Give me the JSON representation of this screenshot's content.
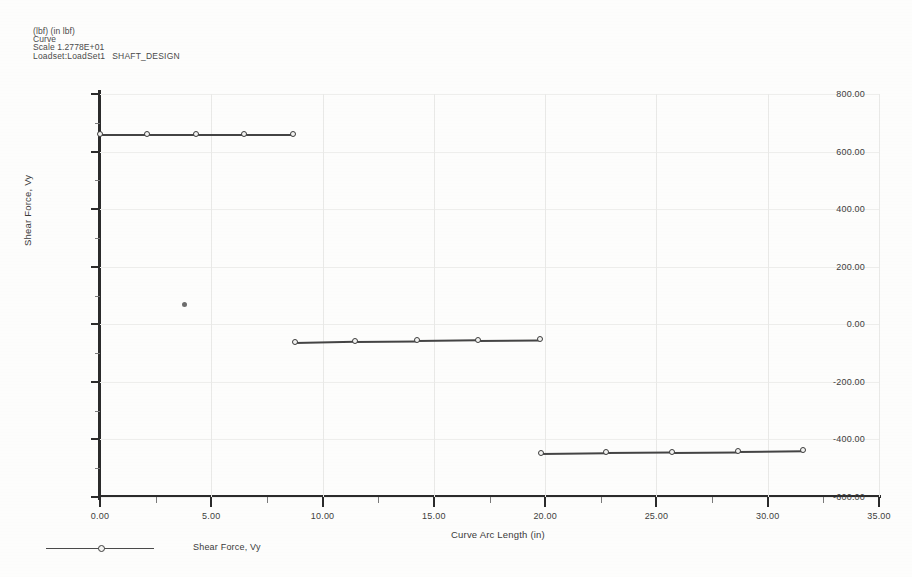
{
  "header": {
    "units": "(lbf)  (in lbf)",
    "curve_label": "Curve",
    "scale_label": "Scale  1.2778E+01",
    "loadset_label": "Loadset:LoadSet1",
    "study_label": "SHAFT_DESIGN"
  },
  "legend": {
    "entry_label": "Shear Force, Vy"
  },
  "chart_data": {
    "type": "line",
    "title": "",
    "subtitle": "",
    "xlabel": "Curve Arc Length (in)",
    "ylabel": "Shear Force, Vy",
    "xlim": [
      0.0,
      35.0
    ],
    "ylim": [
      -600.0,
      800.0
    ],
    "xticks": [
      0.0,
      5.0,
      10.0,
      15.0,
      20.0,
      25.0,
      30.0,
      35.0
    ],
    "xtick_labels": [
      "0.00",
      "5.00",
      "10.00",
      "15.00",
      "20.00",
      "25.00",
      "30.00",
      "35.00"
    ],
    "yticks": [
      -600.0,
      -400.0,
      -200.0,
      0.0,
      200.0,
      400.0,
      600.0,
      800.0
    ],
    "ytick_labels": [
      "-600.00",
      "-400.00",
      "-200.00",
      "0.00",
      "200.00",
      "400.00",
      "600.00",
      "800.00"
    ],
    "minor_tick_count_per_interval": 1,
    "grid": true,
    "grid_axis": "both",
    "legend_position": "bottom-left",
    "series": [
      {
        "name": "Shear Force, Vy",
        "color": "#444444",
        "marker": "circle",
        "segments": [
          {
            "segment_name": "segment-1",
            "points": [
              {
                "x": 0.0,
                "y": 660.0
              },
              {
                "x": 2.1,
                "y": 660.0
              },
              {
                "x": 4.3,
                "y": 660.0
              },
              {
                "x": 6.45,
                "y": 660.0
              },
              {
                "x": 8.65,
                "y": 660.0
              }
            ]
          },
          {
            "segment_name": "segment-2",
            "points": [
              {
                "x": 8.75,
                "y": -62.0
              },
              {
                "x": 11.45,
                "y": -58.0
              },
              {
                "x": 14.25,
                "y": -56.0
              },
              {
                "x": 17.0,
                "y": -53.0
              },
              {
                "x": 19.75,
                "y": -51.0
              }
            ]
          },
          {
            "segment_name": "segment-3",
            "points": [
              {
                "x": 19.8,
                "y": -447.0
              },
              {
                "x": 22.75,
                "y": -444.0
              },
              {
                "x": 25.7,
                "y": -442.0
              },
              {
                "x": 28.65,
                "y": -440.0
              },
              {
                "x": 31.6,
                "y": -437.0
              }
            ]
          }
        ]
      }
    ],
    "stray_points": [
      {
        "x": 3.78,
        "y": 70.0
      }
    ]
  }
}
